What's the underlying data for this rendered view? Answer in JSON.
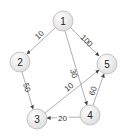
{
  "graph": {
    "type": "directed-weighted",
    "nodes": [
      {
        "id": "1",
        "label": "1",
        "x": 63,
        "y": 21
      },
      {
        "id": "2",
        "label": "2",
        "x": 20,
        "y": 62
      },
      {
        "id": "3",
        "label": "3",
        "x": 37,
        "y": 119
      },
      {
        "id": "4",
        "label": "4",
        "x": 90,
        "y": 115
      },
      {
        "id": "5",
        "label": "5",
        "x": 107,
        "y": 64
      }
    ],
    "edges": [
      {
        "from": "1",
        "to": "2",
        "weight": "10"
      },
      {
        "from": "1",
        "to": "5",
        "weight": "100"
      },
      {
        "from": "1",
        "to": "4",
        "weight": "30"
      },
      {
        "from": "2",
        "to": "3",
        "weight": "50"
      },
      {
        "from": "3",
        "to": "5",
        "weight": "10"
      },
      {
        "from": "4",
        "to": "3",
        "weight": "20"
      },
      {
        "from": "4",
        "to": "5",
        "weight": "60"
      }
    ]
  }
}
